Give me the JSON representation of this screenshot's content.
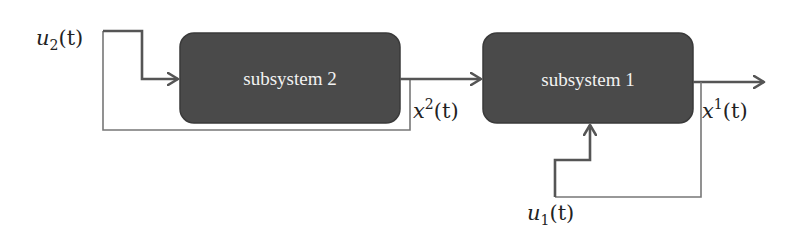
{
  "diagram": {
    "type": "block-diagram",
    "blocks": [
      {
        "id": "subsystem2",
        "label": "subsystem 2"
      },
      {
        "id": "subsystem1",
        "label": "subsystem 1"
      }
    ],
    "signals": {
      "u2": {
        "base": "u",
        "sub": "2",
        "arg": "(t)"
      },
      "x2": {
        "base": "x",
        "sup": "2",
        "arg": "(t)"
      },
      "x1": {
        "base": "x",
        "sup": "1",
        "arg": "(t)"
      },
      "u1": {
        "base": "u",
        "sub": "1",
        "arg": "(t)"
      }
    },
    "edges": [
      {
        "from": "u2",
        "to": "subsystem2"
      },
      {
        "from": "subsystem2",
        "to": "subsystem1",
        "signal": "x2"
      },
      {
        "from": "subsystem1",
        "to": "output",
        "signal": "x1"
      },
      {
        "from": "u1",
        "to": "subsystem1"
      },
      {
        "from": "x2",
        "to": "u2",
        "kind": "feedback"
      },
      {
        "from": "x1",
        "to": "u1",
        "kind": "feedback"
      }
    ],
    "colors": {
      "block_fill": "#4a4a4a",
      "block_stroke": "#3a3a3a",
      "arrow": "#555555",
      "feedback_line": "#777777",
      "block_text": "#f2f2f2"
    }
  }
}
